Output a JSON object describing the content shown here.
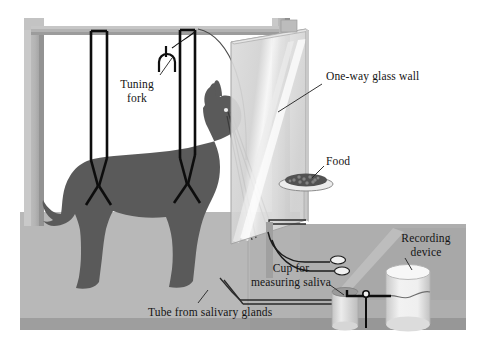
{
  "figure": {
    "type": "diagram",
    "width": 478,
    "height": 354,
    "background_color": "#ffffff"
  },
  "labels": {
    "tuning_fork": "Tuning\nfork",
    "one_way_glass_wall": "One-way glass wall",
    "food": "Food",
    "cup_for_measuring_saliva": "Cup for\nmeasuring saliva",
    "recording_device": "Recording\ndevice",
    "tube_from_salivary_glands": "Tube from salivary glands"
  },
  "palette": {
    "background": "#ffffff",
    "floor_top": "#b6b6b6",
    "floor_front": "#9d9d9d",
    "platform_top": "#aeaeae",
    "platform_side": "#8f8f8f",
    "frame_post": "#b9b9b9",
    "frame_post_shadow": "#9a9a9a",
    "frame_beam": "#b2b2b2",
    "glass_fill": "#d9d9d9",
    "glass_highlight": "#f4f4f4",
    "glass_edge": "#9b9b9b",
    "dog_body": "#5a5a5a",
    "harness_strap": "#0d0d0d",
    "food_bowl": "#e9e9e9",
    "food_kibble": "#4f4f4f",
    "cylinder_light": "#efefef",
    "cylinder_shade": "#c6c6c6",
    "tube_line": "#1c1c1c",
    "leader_line": "#2a2a2a",
    "text": "#141414"
  },
  "parts": [
    {
      "name": "support-frame",
      "description": "Two vertical gray posts joined by a horizontal overhead beam"
    },
    {
      "name": "harness-straps",
      "description": "Two black Y-shaped suspension straps hanging from the beam to the dog"
    },
    {
      "name": "dog-silhouette",
      "description": "Dark gray standing dog in profile facing right"
    },
    {
      "name": "tuning-fork",
      "description": "Small U-shaped tuning fork suspended near the beam"
    },
    {
      "name": "one-way-glass-wall",
      "description": "Translucent light-gray panel with a diagonal highlight, separating dog from observer"
    },
    {
      "name": "food-bowl",
      "description": "Shallow dish of dark kibble on a thin pedestal"
    },
    {
      "name": "saliva-tubes",
      "description": "Two curved tubes running from the dog's cheek to the measuring cup"
    },
    {
      "name": "measuring-cup",
      "description": "Small cylinder collecting saliva"
    },
    {
      "name": "recording-drum",
      "description": "Large cylinder with stylus arm plotting the response"
    },
    {
      "name": "floor-platform",
      "description": "Gray raised floor slab with a second angled platform at right"
    }
  ]
}
